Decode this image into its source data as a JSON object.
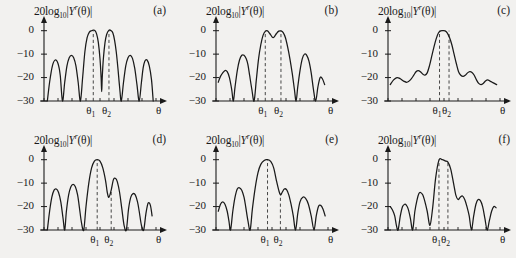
{
  "figure": {
    "background": "#f2f1ef",
    "ink": "#1a1a1a",
    "panel_count": 6
  },
  "axis": {
    "title_prefix": "20log",
    "title_sub": "10",
    "title_mid": "|",
    "title_var": "Y",
    "title_sup": "r",
    "title_arg": "(θ)|",
    "y_ticks": [
      "0",
      "−10",
      "−20",
      "−30"
    ],
    "y_tick_values": [
      0,
      -10,
      -20,
      -30
    ],
    "ylim": [
      -30,
      2
    ],
    "x_axis_label": "θ",
    "marker_labels": [
      "θ",
      "θ"
    ],
    "marker_subs": [
      "1",
      "2"
    ],
    "grid": false,
    "legend": false
  },
  "chart_data": [
    {
      "type": "line",
      "panel": "(a)",
      "title": "20log10|Y^r(θ)|",
      "xlabel": "θ",
      "ylabel": "20log10|Y^r(θ)| (dB)",
      "ylim": [
        -30,
        2
      ],
      "xlim": [
        0,
        1
      ],
      "theta1": 0.44,
      "theta2": 0.58,
      "theta1_line_top": 0,
      "theta2_line_top": 0,
      "description": "Two main lobes at 0 dB located at theta1 and theta2 with a deep null between them; four sidelobes near -10 to -13 dB",
      "x": [
        0.03,
        0.05,
        0.075,
        0.1,
        0.125,
        0.145,
        0.165,
        0.185,
        0.205,
        0.225,
        0.245,
        0.265,
        0.285,
        0.305,
        0.325,
        0.345,
        0.365,
        0.385,
        0.405,
        0.425,
        0.44,
        0.455,
        0.47,
        0.485,
        0.5,
        0.51,
        0.515,
        0.52,
        0.53,
        0.545,
        0.56,
        0.58,
        0.6,
        0.615,
        0.63,
        0.645,
        0.66,
        0.675,
        0.69,
        0.71,
        0.73,
        0.75,
        0.77,
        0.79,
        0.81,
        0.83,
        0.85,
        0.87,
        0.885,
        0.9,
        0.92,
        0.94,
        0.96,
        0.975
      ],
      "y": [
        -30,
        -22,
        -15,
        -12.5,
        -14,
        -19,
        -30,
        -22,
        -15,
        -11.5,
        -10.5,
        -11.5,
        -15,
        -22,
        -30,
        -20,
        -9,
        -3,
        -0.6,
        0,
        0.2,
        0,
        -1.5,
        -5,
        -12,
        -20,
        -26,
        -20,
        -12,
        -5,
        -1.5,
        0.2,
        0,
        -1,
        -4,
        -9,
        -16,
        -24,
        -30,
        -22,
        -15,
        -11.5,
        -10.5,
        -11.8,
        -16,
        -23,
        -30,
        -22,
        -16,
        -13,
        -12.5,
        -15,
        -21,
        -30
      ]
    },
    {
      "type": "line",
      "panel": "(b)",
      "title": "20log10|Y^r(θ)|",
      "xlabel": "θ",
      "ylabel": "20log10|Y^r(θ)| (dB)",
      "ylim": [
        -30,
        2
      ],
      "xlim": [
        0,
        1
      ],
      "theta1": 0.44,
      "theta2": 0.58,
      "theta1_line_top": 0,
      "theta2_line_top": 0,
      "description": "Broad flat-topped main lobe spanning theta1 to theta2 with a shallow -3 dB dip at center; sidelobes near -10 dB and -20 dB",
      "x": [
        0.02,
        0.04,
        0.06,
        0.08,
        0.1,
        0.12,
        0.14,
        0.155,
        0.17,
        0.19,
        0.21,
        0.23,
        0.25,
        0.27,
        0.285,
        0.3,
        0.32,
        0.34,
        0.36,
        0.38,
        0.4,
        0.42,
        0.44,
        0.46,
        0.48,
        0.5,
        0.51,
        0.52,
        0.54,
        0.56,
        0.58,
        0.6,
        0.62,
        0.64,
        0.66,
        0.68,
        0.7,
        0.715,
        0.73,
        0.75,
        0.77,
        0.79,
        0.81,
        0.83,
        0.85,
        0.87,
        0.89,
        0.91,
        0.93,
        0.95,
        0.97
      ],
      "y": [
        -22,
        -19.5,
        -18,
        -17,
        -17.5,
        -20,
        -25,
        -30,
        -24,
        -17,
        -12.5,
        -10.5,
        -10.5,
        -12,
        -14.5,
        -19,
        -25,
        -30,
        -21,
        -12,
        -6,
        -2,
        -0.3,
        -0.1,
        -1.2,
        -2.6,
        -3,
        -2.6,
        -1.2,
        -0.2,
        -0.1,
        -0.8,
        -3,
        -7,
        -12,
        -18,
        -25,
        -30,
        -24,
        -17,
        -12,
        -10,
        -10.5,
        -13,
        -18,
        -25,
        -30,
        -24,
        -20,
        -20.5,
        -23
      ]
    },
    {
      "type": "line",
      "panel": "(c)",
      "title": "20log10|Y^r(θ)|",
      "xlabel": "θ",
      "ylabel": "20log10|Y^r(θ)| (dB)",
      "ylim": [
        -30,
        2
      ],
      "xlim": [
        0,
        1
      ],
      "theta1": 0.46,
      "theta2": 0.545,
      "theta1_line_top": 0,
      "theta2_line_top": 0,
      "description": "Single smooth broad peak at 0 dB covering theta1 and theta2, with gentle shoulders near -18 dB and no deep nulls",
      "x": [
        0.02,
        0.05,
        0.08,
        0.11,
        0.14,
        0.17,
        0.2,
        0.23,
        0.25,
        0.27,
        0.29,
        0.31,
        0.33,
        0.35,
        0.37,
        0.39,
        0.41,
        0.43,
        0.45,
        0.47,
        0.49,
        0.51,
        0.53,
        0.55,
        0.57,
        0.59,
        0.61,
        0.63,
        0.65,
        0.67,
        0.69,
        0.71,
        0.73,
        0.75,
        0.77,
        0.79,
        0.81,
        0.83,
        0.85,
        0.87,
        0.89,
        0.91,
        0.93,
        0.95,
        0.97
      ],
      "y": [
        -23,
        -21,
        -20,
        -20.5,
        -21.5,
        -22,
        -21,
        -19,
        -17.5,
        -17,
        -17.5,
        -18.5,
        -19,
        -18,
        -15,
        -11,
        -7,
        -3.5,
        -1,
        -0.1,
        0,
        -0.1,
        -1,
        -3,
        -6,
        -10,
        -14,
        -17.5,
        -19,
        -19.5,
        -19,
        -18,
        -17.5,
        -17.8,
        -19,
        -21,
        -22.5,
        -23,
        -22.5,
        -21.5,
        -21,
        -21.5,
        -22,
        -22.5,
        -23
      ]
    },
    {
      "type": "line",
      "panel": "(d)",
      "title": "20log10|Y^r(θ)|",
      "xlabel": "θ",
      "ylabel": "20log10|Y^r(θ)| (dB)",
      "ylim": [
        -30,
        2
      ],
      "xlim": [
        0,
        1
      ],
      "theta1": 0.475,
      "theta2": 0.6,
      "theta1_line_top": 0,
      "theta2_line_top": -13,
      "description": "Single main lobe at 0 dB centred on theta1; theta2 falls on the first sidelobe near -13 dB; five sidelobes between -10 and -20 dB",
      "x": [
        0.03,
        0.05,
        0.07,
        0.09,
        0.11,
        0.13,
        0.15,
        0.17,
        0.185,
        0.2,
        0.22,
        0.24,
        0.26,
        0.28,
        0.3,
        0.315,
        0.335,
        0.355,
        0.375,
        0.4,
        0.425,
        0.45,
        0.475,
        0.5,
        0.525,
        0.55,
        0.565,
        0.58,
        0.6,
        0.62,
        0.64,
        0.655,
        0.675,
        0.695,
        0.715,
        0.735,
        0.755,
        0.775,
        0.795,
        0.815,
        0.835,
        0.85,
        0.87,
        0.89,
        0.91,
        0.93,
        0.95,
        0.965
      ],
      "y": [
        -30,
        -22,
        -16,
        -13,
        -12.5,
        -14,
        -18,
        -25,
        -30,
        -22,
        -15,
        -11.5,
        -10.5,
        -11.5,
        -15,
        -20,
        -27,
        -30,
        -20,
        -10,
        -3.5,
        -0.6,
        0,
        -0.6,
        -3.5,
        -9,
        -14,
        -16,
        -13,
        -8.5,
        -8,
        -9.5,
        -14,
        -21,
        -28,
        -30,
        -21,
        -16,
        -14.5,
        -15,
        -18,
        -22,
        -28,
        -30,
        -23,
        -18.5,
        -19.5,
        -24
      ]
    },
    {
      "type": "line",
      "panel": "(e)",
      "title": "20log10|Y^r(θ)|",
      "xlabel": "θ",
      "ylabel": "20log10|Y^r(θ)| (dB)",
      "ylim": [
        -30,
        2
      ],
      "xlim": [
        0,
        1
      ],
      "theta1": 0.46,
      "theta2": 0.575,
      "theta1_line_top": 0,
      "theta2_line_top": -15,
      "description": "Main lobe at 0 dB at theta1; theta2 sits in a shallow notch near -15 dB between the main lobe and a -12 dB sidelobe",
      "x": [
        0.02,
        0.04,
        0.06,
        0.08,
        0.1,
        0.115,
        0.13,
        0.15,
        0.17,
        0.19,
        0.21,
        0.23,
        0.25,
        0.265,
        0.285,
        0.305,
        0.325,
        0.35,
        0.375,
        0.4,
        0.43,
        0.46,
        0.49,
        0.515,
        0.54,
        0.56,
        0.575,
        0.59,
        0.61,
        0.63,
        0.65,
        0.67,
        0.69,
        0.71,
        0.73,
        0.75,
        0.775,
        0.8,
        0.825,
        0.85,
        0.875,
        0.895,
        0.915,
        0.935,
        0.955,
        0.975
      ],
      "y": [
        -22,
        -19,
        -18,
        -19,
        -22,
        -26,
        -30,
        -22,
        -16,
        -12.5,
        -12,
        -13,
        -16,
        -20,
        -26,
        -30,
        -21,
        -12,
        -5.5,
        -2,
        -0.3,
        0,
        -0.8,
        -3.5,
        -9,
        -13,
        -15,
        -14,
        -12.5,
        -12.8,
        -15,
        -19,
        -24,
        -30,
        -23,
        -18,
        -16,
        -16.5,
        -19,
        -24,
        -30,
        -24,
        -20,
        -19.5,
        -21,
        -24
      ]
    },
    {
      "type": "line",
      "panel": "(f)",
      "title": "20log10|Y^r(θ)|",
      "xlabel": "θ",
      "ylabel": "20log10|Y^r(θ)| (dB)",
      "ylim": [
        -30,
        2
      ],
      "xlim": [
        0,
        1
      ],
      "theta1": 0.455,
      "theta2": 0.535,
      "theta1_line_top": 0,
      "theta2_line_top": -1,
      "description": "Rounded main lobe at 0 dB containing theta1 and theta2; asymmetric sidelobes between -14 and -22 dB with deep nulls",
      "x": [
        0.02,
        0.04,
        0.06,
        0.075,
        0.09,
        0.11,
        0.13,
        0.15,
        0.165,
        0.18,
        0.2,
        0.22,
        0.24,
        0.26,
        0.275,
        0.29,
        0.31,
        0.33,
        0.35,
        0.375,
        0.4,
        0.425,
        0.455,
        0.485,
        0.51,
        0.535,
        0.56,
        0.585,
        0.605,
        0.625,
        0.645,
        0.665,
        0.685,
        0.705,
        0.725,
        0.745,
        0.765,
        0.785,
        0.805,
        0.825,
        0.845,
        0.865,
        0.885,
        0.905,
        0.925,
        0.945,
        0.965
      ],
      "y": [
        -20,
        -21.5,
        -24,
        -28,
        -30,
        -24,
        -20,
        -19,
        -19.5,
        -21,
        -25,
        -30,
        -22,
        -17,
        -14.5,
        -14,
        -15,
        -18,
        -22,
        -28,
        -20,
        -8,
        -0.2,
        0,
        -0.5,
        -1,
        -4,
        -10,
        -15,
        -17,
        -16,
        -15.5,
        -17,
        -20,
        -24,
        -30,
        -24,
        -19,
        -17,
        -17.5,
        -20,
        -25,
        -30,
        -26,
        -22,
        -20,
        -20.5
      ]
    }
  ],
  "panels": [
    {
      "label": "(a)"
    },
    {
      "label": "(b)"
    },
    {
      "label": "(c)"
    },
    {
      "label": "(d)"
    },
    {
      "label": "(e)"
    },
    {
      "label": "(f)"
    }
  ]
}
